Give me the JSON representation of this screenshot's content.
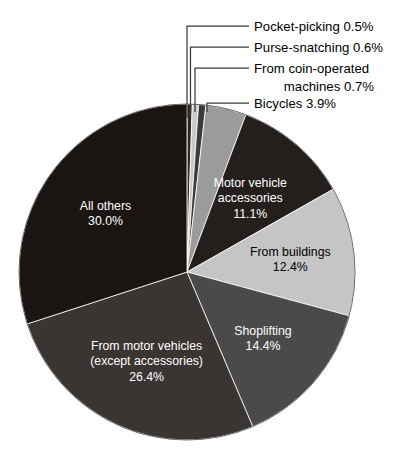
{
  "chart_data": {
    "type": "pie",
    "title": "",
    "subtitle": "",
    "xlabel": "",
    "ylabel": "",
    "legend_position": "none",
    "grid": false,
    "units": "percent",
    "total": 100.0,
    "categories": [
      "Pocket-picking",
      "Purse-snatching",
      "From coin-operated machines",
      "Bicycles",
      "Motor vehicle accessories",
      "From buildings",
      "Shoplifting",
      "From motor vehicles (except accessories)",
      "All others"
    ],
    "values": [
      0.5,
      0.6,
      0.7,
      3.9,
      11.1,
      12.4,
      14.4,
      26.4,
      30.0
    ],
    "slices": [
      {
        "name": "Pocket-picking",
        "value": 0.5,
        "label_line1": "Pocket-picking 0.5%",
        "label_line2": "",
        "value_text": "0.5%",
        "color": "#2b2724",
        "label_placement": "callout",
        "text_color": "#000000"
      },
      {
        "name": "Purse-snatching",
        "value": 0.6,
        "label_line1": "Purse-snatching 0.6%",
        "label_line2": "",
        "value_text": "0.6%",
        "color": "#c9c9c9",
        "label_placement": "callout",
        "text_color": "#000000"
      },
      {
        "name": "From coin-operated machines",
        "value": 0.7,
        "label_line1": "From coin-operated",
        "label_line2": "machines 0.7%",
        "value_text": "0.7%",
        "color": "#3d3a37",
        "label_placement": "callout",
        "text_color": "#000000"
      },
      {
        "name": "Bicycles",
        "value": 3.9,
        "label_line1": "Bicycles 3.9%",
        "label_line2": "",
        "value_text": "3.9%",
        "color": "#9b9b9b",
        "label_placement": "callout",
        "text_color": "#000000"
      },
      {
        "name": "Motor vehicle accessories",
        "value": 11.1,
        "label_line1": "Motor vehicle",
        "label_line2": "accessories",
        "value_text": "11.1%",
        "color": "#241f1d",
        "label_placement": "inside",
        "text_color": "#ffffff"
      },
      {
        "name": "From buildings",
        "value": 12.4,
        "label_line1": "From buildings",
        "label_line2": "",
        "value_text": "12.4%",
        "color": "#c5c5c5",
        "label_placement": "inside",
        "text_color": "#000000"
      },
      {
        "name": "Shoplifting",
        "value": 14.4,
        "label_line1": "Shoplifting",
        "label_line2": "",
        "value_text": "14.4%",
        "color": "#4a4a4a",
        "label_placement": "inside",
        "text_color": "#ffffff"
      },
      {
        "name": "From motor vehicles (except accessories)",
        "value": 26.4,
        "label_line1": "From motor vehicles",
        "label_line2": "(except accessories)",
        "value_text": "26.4%",
        "color": "#3a3533",
        "label_placement": "inside",
        "text_color": "#ffffff"
      },
      {
        "name": "All others",
        "value": 30.0,
        "label_line1": "All others",
        "label_line2": "",
        "value_text": "30.0%",
        "color": "#1a1413",
        "label_placement": "inside",
        "text_color": "#ffffff"
      }
    ],
    "geometry": {
      "center_x": 187,
      "center_y": 272,
      "radius": 168,
      "start_angle_deg": 0,
      "direction": "clockwise"
    }
  }
}
